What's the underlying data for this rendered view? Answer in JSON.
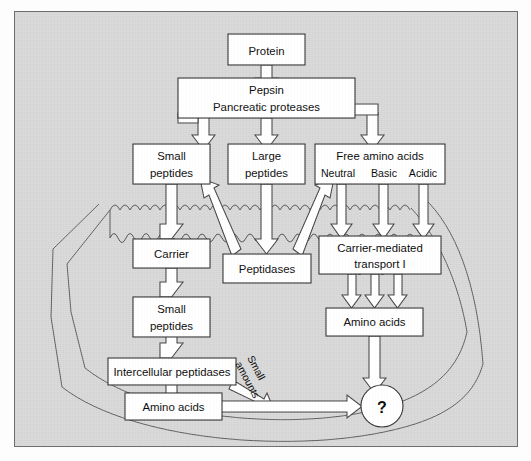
{
  "figure": {
    "panel_background": "#d6d6d6",
    "box_fill": "#ffffff",
    "line_color": "#2b2b2b"
  },
  "nodes": {
    "protein": {
      "label": "Protein"
    },
    "enzymes_line1": {
      "label": "Pepsin"
    },
    "enzymes_line2": {
      "label": "Pancreatic proteases"
    },
    "small_peptides_lumen_l1": {
      "label": "Small"
    },
    "small_peptides_lumen_l2": {
      "label": "peptides"
    },
    "large_peptides_l1": {
      "label": "Large"
    },
    "large_peptides_l2": {
      "label": "peptides"
    },
    "free_amino_acids": {
      "label": "Free amino acids"
    },
    "aa_neutral": {
      "label": "Neutral"
    },
    "aa_basic": {
      "label": "Basic"
    },
    "aa_acidic": {
      "label": "Acidic"
    },
    "carrier": {
      "label": "Carrier"
    },
    "peptidases": {
      "label": "Peptidases"
    },
    "carrier_transport_l1": {
      "label": "Carrier-mediated"
    },
    "carrier_transport_l2": {
      "label": "transport I"
    },
    "small_peptides_cell_l1": {
      "label": "Small"
    },
    "small_peptides_cell_l2": {
      "label": "peptides"
    },
    "amino_acids_right": {
      "label": "Amino acids"
    },
    "intercellular_peptidases": {
      "label": "Intercellular peptidases"
    },
    "amino_acids_bottom": {
      "label": "Amino acids"
    },
    "unknown": {
      "label": "?"
    }
  },
  "annotations": {
    "small_amounts_l1": "Small",
    "small_amounts_l2": "amounts"
  }
}
